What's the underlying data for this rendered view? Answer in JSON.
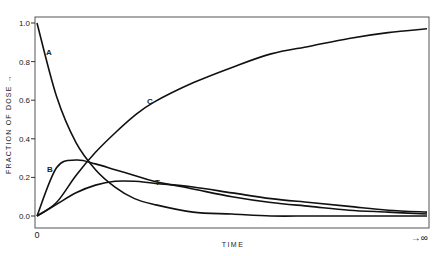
{
  "chart_data": {
    "type": "line",
    "title": "",
    "xlabel": "TIME",
    "ylabel": "FRACTION OF DOSE →",
    "x_start_label": "0",
    "x_end_label": "→∞",
    "ylim": [
      0,
      1.0
    ],
    "yticks": [
      "0.0",
      "0.2",
      "0.4",
      "0.6",
      "0.8",
      "1.0"
    ],
    "grid": false,
    "legend": "inline labels",
    "x": [
      0,
      0.05,
      0.1,
      0.15,
      0.2,
      0.25,
      0.3,
      0.4,
      0.5,
      0.6,
      0.7,
      0.8,
      0.9,
      1.0
    ],
    "series": [
      {
        "name": "A",
        "values": [
          1.0,
          0.62,
          0.38,
          0.24,
          0.15,
          0.09,
          0.06,
          0.02,
          0.01,
          0.0,
          0.0,
          0.0,
          0.0,
          0.0
        ]
      },
      {
        "name": "B",
        "values": [
          0.0,
          0.25,
          0.29,
          0.27,
          0.24,
          0.21,
          0.18,
          0.14,
          0.1,
          0.07,
          0.05,
          0.03,
          0.02,
          0.01
        ]
      },
      {
        "name": "T",
        "values": [
          0.0,
          0.06,
          0.12,
          0.16,
          0.18,
          0.18,
          0.17,
          0.15,
          0.12,
          0.09,
          0.07,
          0.05,
          0.03,
          0.02
        ]
      },
      {
        "name": "C",
        "values": [
          0.0,
          0.07,
          0.21,
          0.33,
          0.43,
          0.52,
          0.59,
          0.69,
          0.77,
          0.84,
          0.88,
          0.92,
          0.95,
          0.97
        ]
      }
    ]
  }
}
